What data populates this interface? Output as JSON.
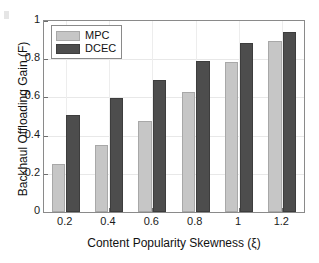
{
  "chart_data": {
    "type": "bar",
    "title": "",
    "xlabel": "Content Popularity Skewness (ξ)",
    "ylabel": "Backhaul Offloading Gain (F)",
    "categories": [
      "0.2",
      "0.4",
      "0.6",
      "0.8",
      "1",
      "1.2"
    ],
    "x_tick_labels": [
      "0.2",
      "0.4",
      "0.6",
      "0.8",
      "1",
      "1.2"
    ],
    "y_tick_labels": [
      "0",
      "0.2",
      "0.4",
      "0.6",
      "0.8",
      "1"
    ],
    "y_ticks": [
      0,
      0.2,
      0.4,
      0.6,
      0.8,
      1
    ],
    "xlim": [
      0.1,
      1.3
    ],
    "ylim": [
      0,
      1
    ],
    "grid": true,
    "legend_position": "upper-left",
    "series": [
      {
        "name": "MPC",
        "color": "#c6c6c6",
        "values": [
          0.25,
          0.35,
          0.475,
          0.63,
          0.785,
          0.895
        ]
      },
      {
        "name": "DCEC",
        "color": "#4d4d4d",
        "values": [
          0.51,
          0.595,
          0.69,
          0.79,
          0.885,
          0.945
        ]
      }
    ]
  },
  "legend": {
    "items": [
      {
        "label": "MPC",
        "series": "mpc"
      },
      {
        "label": "DCEC",
        "series": "dcec"
      }
    ]
  },
  "colors": {
    "mpc_bar": "#c6c6c6",
    "dcec_bar": "#4d4d4d",
    "axis": "#8a8a8a",
    "grid": "#e8e8e8",
    "background": "#ffffff",
    "text": "#111111"
  }
}
